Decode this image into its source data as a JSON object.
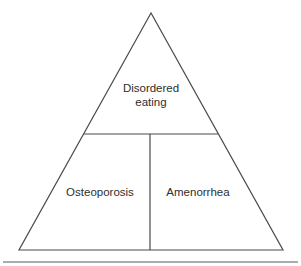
{
  "diagram": {
    "type": "triangle",
    "sections": {
      "top": {
        "line1": "Disordered",
        "line2": "eating"
      },
      "bottom_left": {
        "label": "Osteoporosis"
      },
      "bottom_right": {
        "label": "Amenorrhea"
      }
    },
    "colors": {
      "stroke": "#4a4a4a",
      "text": "#2e2e2e",
      "background": "#ffffff"
    }
  }
}
